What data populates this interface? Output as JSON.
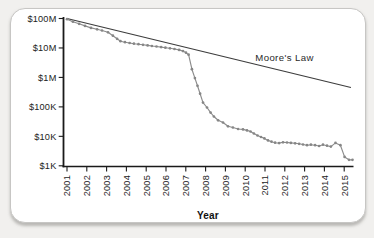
{
  "page": {
    "background_color": "#f1f0ee"
  },
  "card": {
    "background_color": "#ffffff",
    "border_color": "#c7c6c4"
  },
  "chart_data": {
    "type": "line",
    "title": "",
    "xlabel": "Year",
    "ylabel": "",
    "y_scale": "log",
    "grid": false,
    "x_tick_labels": [
      "2001",
      "2002",
      "2003",
      "2004",
      "2005",
      "2006",
      "2007",
      "2008",
      "2009",
      "2010",
      "2011",
      "2012",
      "2013",
      "2014",
      "2015"
    ],
    "y_tick_labels": [
      "$100M",
      "$10M",
      "$1M",
      "$100K",
      "$10K",
      "$1K"
    ],
    "y_tick_values": [
      100000000,
      10000000,
      1000000,
      100000,
      10000,
      1000
    ],
    "x_range": [
      2000.82,
      2015.47
    ],
    "y_range": [
      1000,
      100000000
    ],
    "axis_color": "#1a1a1a",
    "series": [
      {
        "name": "sequencing-cost",
        "color": "#8c8c8c",
        "marker": "circle",
        "points": [
          [
            2001.0,
            95000000
          ],
          [
            2001.3,
            78000000
          ],
          [
            2001.61,
            66000000
          ],
          [
            2001.91,
            56000000
          ],
          [
            2002.21,
            48000000
          ],
          [
            2002.52,
            43000000
          ],
          [
            2002.77,
            39000000
          ],
          [
            2003.07,
            34000000
          ],
          [
            2003.32,
            26000000
          ],
          [
            2003.53,
            20500000
          ],
          [
            2003.7,
            17000000
          ],
          [
            2003.93,
            15700000
          ],
          [
            2004.16,
            14700000
          ],
          [
            2004.38,
            14000000
          ],
          [
            2004.61,
            13400000
          ],
          [
            2004.84,
            12800000
          ],
          [
            2005.07,
            12200000
          ],
          [
            2005.29,
            11700000
          ],
          [
            2005.52,
            11200000
          ],
          [
            2005.75,
            10700000
          ],
          [
            2005.97,
            10200000
          ],
          [
            2006.2,
            9700000
          ],
          [
            2006.43,
            9200000
          ],
          [
            2006.66,
            8600000
          ],
          [
            2006.86,
            7800000
          ],
          [
            2007.01,
            6900000
          ],
          [
            2007.14,
            5900000
          ],
          [
            2007.31,
            1900000
          ],
          [
            2007.46,
            950000
          ],
          [
            2007.59,
            520000
          ],
          [
            2007.72,
            280000
          ],
          [
            2007.87,
            140000
          ],
          [
            2008.07,
            95000
          ],
          [
            2008.25,
            64000
          ],
          [
            2008.42,
            47000
          ],
          [
            2008.63,
            35000
          ],
          [
            2008.88,
            29500
          ],
          [
            2009.13,
            22000
          ],
          [
            2009.38,
            20000
          ],
          [
            2009.64,
            17800
          ],
          [
            2009.89,
            17200
          ],
          [
            2010.09,
            15900
          ],
          [
            2010.27,
            14600
          ],
          [
            2010.44,
            12500
          ],
          [
            2010.62,
            10700
          ],
          [
            2010.8,
            9500
          ],
          [
            2010.97,
            8500
          ],
          [
            2011.15,
            7300
          ],
          [
            2011.33,
            6600
          ],
          [
            2011.51,
            6100
          ],
          [
            2011.71,
            5900
          ],
          [
            2011.91,
            6300
          ],
          [
            2012.11,
            6200
          ],
          [
            2012.31,
            6000
          ],
          [
            2012.52,
            5800
          ],
          [
            2012.72,
            5600
          ],
          [
            2012.92,
            5300
          ],
          [
            2013.12,
            5000
          ],
          [
            2013.32,
            5200
          ],
          [
            2013.53,
            5000
          ],
          [
            2013.73,
            4700
          ],
          [
            2013.93,
            5200
          ],
          [
            2014.13,
            4800
          ],
          [
            2014.33,
            4500
          ],
          [
            2014.56,
            6000
          ],
          [
            2014.81,
            5000
          ],
          [
            2015.02,
            2000
          ],
          [
            2015.24,
            1600
          ],
          [
            2015.42,
            1600
          ]
        ]
      },
      {
        "name": "moores-law",
        "label": "Moore's Law",
        "color": "#3d3d3d",
        "marker": "none",
        "points": [
          [
            2001.0,
            100000000
          ],
          [
            2015.34,
            455000
          ]
        ]
      }
    ]
  }
}
